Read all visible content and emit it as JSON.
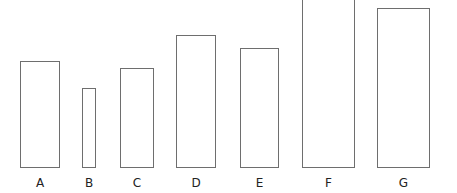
{
  "diagram": {
    "stroke_color": "#6e6e6e",
    "background": "#ffffff",
    "items": [
      {
        "label": "A",
        "x": 20,
        "top": 61,
        "width": 40,
        "bottom": 168
      },
      {
        "label": "B",
        "x": 82,
        "top": 88,
        "width": 14,
        "bottom": 168
      },
      {
        "label": "C",
        "x": 120,
        "top": 68,
        "width": 34,
        "bottom": 168
      },
      {
        "label": "D",
        "x": 176,
        "top": 35,
        "width": 40,
        "bottom": 168
      },
      {
        "label": "E",
        "x": 240,
        "top": 48,
        "width": 39,
        "bottom": 168
      },
      {
        "label": "F",
        "x": 302,
        "top": -2,
        "width": 53,
        "bottom": 168
      },
      {
        "label": "G",
        "x": 377,
        "top": 8,
        "width": 53,
        "bottom": 168
      }
    ]
  }
}
